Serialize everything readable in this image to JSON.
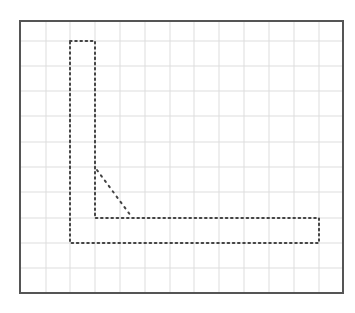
{
  "diagram": {
    "type": "dotted-shape-on-grid",
    "frame": {
      "x": 20,
      "y": 21,
      "width": 323,
      "height": 272,
      "stroke": "#555555"
    },
    "grid": {
      "color": "#dddddd",
      "columns": 13,
      "rows": 11,
      "vertical_lines_x": [
        46,
        70,
        95,
        120,
        145,
        170,
        194,
        219,
        244,
        269,
        294,
        319
      ],
      "horizontal_lines_y": [
        41,
        66,
        91,
        116,
        142,
        167,
        192,
        218,
        243,
        268
      ]
    },
    "shape": {
      "description": "L-shaped outline drawn with dotted lines",
      "dot_color": "#444444",
      "outline_points": [
        [
          70,
          41
        ],
        [
          95,
          41
        ],
        [
          95,
          218
        ],
        [
          319,
          218
        ],
        [
          319,
          243
        ],
        [
          70,
          243
        ]
      ],
      "diagonal": {
        "from": [
          97,
          170
        ],
        "to": [
          131,
          216
        ]
      }
    }
  }
}
